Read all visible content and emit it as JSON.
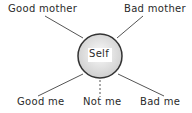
{
  "diagram": {
    "center": {
      "label": "Self"
    },
    "nodes": [
      {
        "id": "good_mother",
        "label": "Good mother"
      },
      {
        "id": "bad_mother",
        "label": "Bad mother"
      },
      {
        "id": "good_me",
        "label": "Good me"
      },
      {
        "id": "not_me",
        "label": "Not me"
      },
      {
        "id": "bad_me",
        "label": "Bad me"
      }
    ],
    "edges": [
      {
        "from": "good_mother",
        "to": "self",
        "style": "solid"
      },
      {
        "from": "bad_mother",
        "to": "self",
        "style": "solid"
      },
      {
        "from": "good_me",
        "to": "self",
        "style": "solid"
      },
      {
        "from": "not_me",
        "to": "self",
        "style": "dashed"
      },
      {
        "from": "bad_me",
        "to": "self",
        "style": "solid"
      }
    ]
  }
}
